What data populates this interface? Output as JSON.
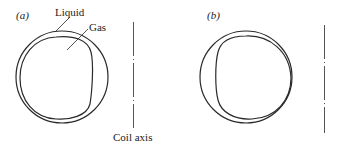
{
  "figure": {
    "panel_a": {
      "label": "(a)",
      "annotations": {
        "liquid": "Liquid",
        "gas": "Gas",
        "axis": "Coil axis"
      }
    },
    "panel_b": {
      "label": "(b)"
    }
  },
  "colors": {
    "line": "#2a2a2a",
    "axis": "#555555",
    "background": "#ffffff"
  }
}
